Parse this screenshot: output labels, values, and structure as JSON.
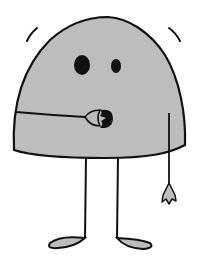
{
  "illustration": {
    "subject": "Gray dome-shaped cartoon character with two legs, one arm reaching to a round mouth, the other arm hanging with a small hand",
    "colors": {
      "body_fill": "#bdbdbd",
      "outline": "#111111",
      "background": "#ffffff",
      "feet_fill": "#bdbdbd"
    },
    "elements": [
      "body",
      "left-eye",
      "right-eye",
      "mouth",
      "left-arm",
      "right-arm",
      "right-hand",
      "left-leg",
      "right-leg",
      "left-foot",
      "right-foot",
      "motion-line-left",
      "motion-line-right"
    ]
  }
}
